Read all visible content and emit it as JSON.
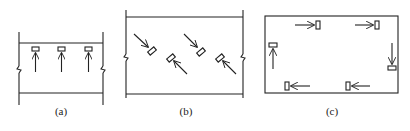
{
  "figure": {
    "panels": [
      {
        "id": "a",
        "label": "(a)",
        "description": "Luminaires in a row, all aimed in the same direction perpendicular to the corridor"
      },
      {
        "id": "b",
        "label": "(b)",
        "description": "Luminaires in staggered arrangement, aimed obliquely"
      },
      {
        "id": "c",
        "label": "(c)",
        "description": "Luminaires around the perimeter of a room, aimed in a circulating direction"
      }
    ],
    "colors": {
      "stroke": "#222222",
      "background": "#ffffff"
    }
  }
}
